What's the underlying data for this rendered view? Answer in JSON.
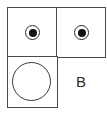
{
  "diagram": {
    "grid": {
      "rows": 2,
      "cols": 2,
      "border_color": "#4a4a4a"
    },
    "cells": [
      {
        "position": "top-left",
        "content": "target-circle",
        "icon": "bullseye-icon"
      },
      {
        "position": "top-right",
        "content": "target-circle",
        "icon": "bullseye-icon"
      },
      {
        "position": "bottom-left",
        "content": "empty-circle",
        "icon": "circle-icon"
      },
      {
        "position": "bottom-right",
        "content": "label",
        "text": "B"
      }
    ],
    "label": "B"
  }
}
